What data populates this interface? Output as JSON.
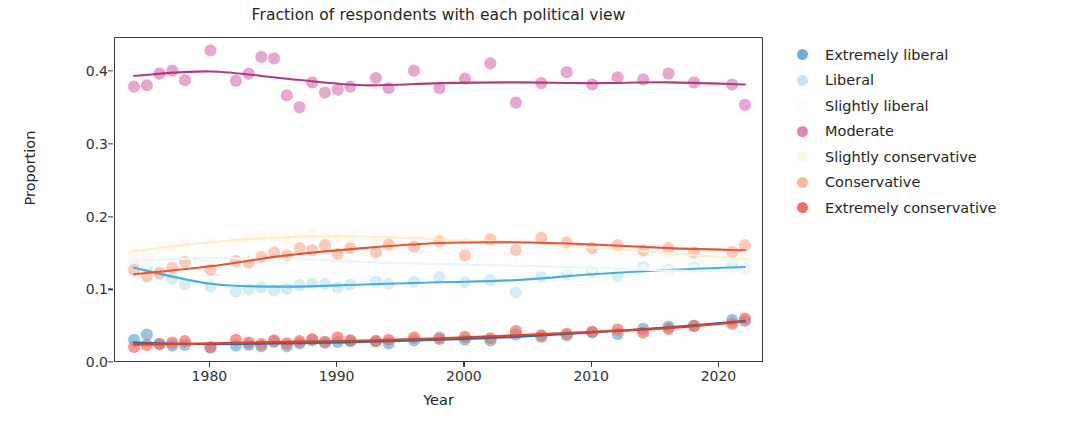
{
  "chart_data": {
    "type": "scatter",
    "title": "Fraction of respondents with each political view",
    "xlabel": "Year",
    "ylabel": "Proportion",
    "xlim": [
      1972.5,
      2023.5
    ],
    "ylim": [
      0.0,
      0.447
    ],
    "grid": false,
    "legend_position": "right",
    "xticks": [
      1980,
      1990,
      2000,
      2010,
      2020
    ],
    "xtick_labels": [
      "1980",
      "1990",
      "2000",
      "2010",
      "2020"
    ],
    "yticks": [
      0.0,
      0.1,
      0.2,
      0.3,
      0.4
    ],
    "ytick_labels": [
      "0.0",
      "0.1",
      "0.2",
      "0.3",
      "0.4"
    ],
    "marker_style": "filled-circle",
    "trendline_style": "lowess-smooth",
    "series": [
      {
        "name": "Extremely liberal",
        "color": "#6cb0da",
        "line_color": "#2a6f9e",
        "x": [
          1974,
          1975,
          1976,
          1977,
          1978,
          1980,
          1982,
          1983,
          1984,
          1985,
          1986,
          1987,
          1988,
          1989,
          1990,
          1991,
          1993,
          1994,
          1996,
          1998,
          2000,
          2002,
          2004,
          2006,
          2008,
          2010,
          2012,
          2014,
          2016,
          2018,
          2021,
          2022
        ],
        "y": [
          0.032,
          0.039,
          0.026,
          0.024,
          0.025,
          0.021,
          0.024,
          0.025,
          0.023,
          0.029,
          0.023,
          0.027,
          0.031,
          0.028,
          0.029,
          0.03,
          0.03,
          0.027,
          0.031,
          0.035,
          0.032,
          0.031,
          0.039,
          0.036,
          0.038,
          0.042,
          0.04,
          0.047,
          0.05,
          0.051,
          0.059,
          0.058
        ],
        "trend_x": [
          1974,
          1980,
          1986,
          1992,
          1998,
          2004,
          2010,
          2016,
          2022
        ],
        "trend_y": [
          0.028,
          0.026,
          0.027,
          0.029,
          0.032,
          0.036,
          0.042,
          0.049,
          0.058
        ]
      },
      {
        "name": "Liberal",
        "color": "#c3e6f2",
        "line_color": "#49aede",
        "x": [
          1974,
          1975,
          1976,
          1977,
          1978,
          1980,
          1982,
          1983,
          1984,
          1985,
          1986,
          1987,
          1988,
          1989,
          1990,
          1991,
          1993,
          1994,
          1996,
          1998,
          2000,
          2002,
          2004,
          2006,
          2008,
          2010,
          2012,
          2014,
          2016,
          2018,
          2021,
          2022
        ],
        "y": [
          0.139,
          0.13,
          0.122,
          0.116,
          0.108,
          0.105,
          0.098,
          0.101,
          0.104,
          0.1,
          0.102,
          0.107,
          0.11,
          0.109,
          0.104,
          0.108,
          0.112,
          0.109,
          0.112,
          0.118,
          0.111,
          0.114,
          0.097,
          0.119,
          0.122,
          0.126,
          0.12,
          0.132,
          0.128,
          0.131,
          0.136,
          0.129
        ],
        "trend_x": [
          1974,
          1980,
          1986,
          1992,
          1998,
          2004,
          2010,
          2016,
          2022
        ],
        "trend_y": [
          0.131,
          0.109,
          0.105,
          0.108,
          0.111,
          0.114,
          0.122,
          0.128,
          0.132
        ]
      },
      {
        "name": "Slightly liberal",
        "color": "#fbfdfa",
        "line_color": "#e9f5fb",
        "x": [
          1974,
          1975,
          1976,
          1977,
          1978,
          1980,
          1982,
          1983,
          1984,
          1985,
          1986,
          1987,
          1988,
          1989,
          1990,
          1991,
          1993,
          1994,
          1996,
          1998,
          2000,
          2002,
          2004,
          2006,
          2008,
          2010,
          2012,
          2014,
          2016,
          2018,
          2021,
          2022
        ],
        "y": [
          0.14,
          0.138,
          0.142,
          0.145,
          0.148,
          0.143,
          0.14,
          0.142,
          0.145,
          0.146,
          0.143,
          0.14,
          0.138,
          0.141,
          0.143,
          0.14,
          0.138,
          0.135,
          0.138,
          0.136,
          0.134,
          0.137,
          0.135,
          0.133,
          0.13,
          0.132,
          0.13,
          0.128,
          0.126,
          0.128,
          0.125,
          0.127
        ],
        "trend_x": [
          1974,
          1980,
          1986,
          1992,
          1998,
          2004,
          2010,
          2016,
          2022
        ],
        "trend_y": [
          0.141,
          0.144,
          0.143,
          0.139,
          0.136,
          0.134,
          0.131,
          0.127,
          0.126
        ]
      },
      {
        "name": "Moderate",
        "color": "#dd86bb",
        "line_color": "#b13a86",
        "x": [
          1974,
          1975,
          1976,
          1977,
          1978,
          1980,
          1982,
          1983,
          1984,
          1985,
          1986,
          1987,
          1988,
          1989,
          1990,
          1991,
          1993,
          1994,
          1996,
          1998,
          2000,
          2002,
          2004,
          2006,
          2008,
          2010,
          2012,
          2014,
          2016,
          2018,
          2021,
          2022
        ],
        "y": [
          0.38,
          0.382,
          0.398,
          0.402,
          0.389,
          0.43,
          0.388,
          0.398,
          0.421,
          0.419,
          0.368,
          0.352,
          0.386,
          0.372,
          0.376,
          0.38,
          0.392,
          0.378,
          0.402,
          0.378,
          0.391,
          0.412,
          0.358,
          0.385,
          0.4,
          0.383,
          0.393,
          0.39,
          0.398,
          0.386,
          0.383,
          0.355
        ],
        "trend_x": [
          1974,
          1980,
          1986,
          1992,
          1998,
          2004,
          2010,
          2016,
          2022
        ],
        "trend_y": [
          0.395,
          0.401,
          0.391,
          0.382,
          0.385,
          0.386,
          0.385,
          0.386,
          0.383
        ]
      },
      {
        "name": "Slightly conservative",
        "color": "#fdf8e6",
        "line_color": "#fdeccd",
        "x": [
          1974,
          1975,
          1976,
          1977,
          1978,
          1980,
          1982,
          1983,
          1984,
          1985,
          1986,
          1987,
          1988,
          1989,
          1990,
          1991,
          1993,
          1994,
          1996,
          1998,
          2000,
          2002,
          2004,
          2006,
          2008,
          2010,
          2012,
          2014,
          2016,
          2018,
          2021,
          2022
        ],
        "y": [
          0.152,
          0.148,
          0.158,
          0.16,
          0.163,
          0.166,
          0.168,
          0.17,
          0.172,
          0.175,
          0.17,
          0.176,
          0.178,
          0.174,
          0.172,
          0.175,
          0.17,
          0.172,
          0.168,
          0.17,
          0.166,
          0.165,
          0.168,
          0.163,
          0.16,
          0.158,
          0.155,
          0.152,
          0.15,
          0.148,
          0.142,
          0.145
        ],
        "trend_x": [
          1974,
          1980,
          1986,
          1992,
          1998,
          2004,
          2010,
          2016,
          2022
        ],
        "trend_y": [
          0.154,
          0.166,
          0.173,
          0.174,
          0.17,
          0.166,
          0.159,
          0.151,
          0.143
        ]
      },
      {
        "name": "Conservative",
        "color": "#fbb79c",
        "line_color": "#e2563a",
        "x": [
          1974,
          1975,
          1976,
          1977,
          1978,
          1980,
          1982,
          1983,
          1984,
          1985,
          1986,
          1987,
          1988,
          1989,
          1990,
          1991,
          1993,
          1994,
          1996,
          1998,
          2000,
          2002,
          2004,
          2006,
          2008,
          2010,
          2012,
          2014,
          2016,
          2018,
          2021,
          2022
        ],
        "y": [
          0.128,
          0.119,
          0.124,
          0.131,
          0.139,
          0.128,
          0.14,
          0.138,
          0.146,
          0.152,
          0.148,
          0.158,
          0.155,
          0.162,
          0.15,
          0.158,
          0.152,
          0.163,
          0.16,
          0.167,
          0.148,
          0.17,
          0.155,
          0.172,
          0.166,
          0.158,
          0.162,
          0.155,
          0.158,
          0.152,
          0.153,
          0.162
        ],
        "trend_x": [
          1974,
          1980,
          1986,
          1992,
          1998,
          2004,
          2010,
          2016,
          2022
        ],
        "trend_y": [
          0.122,
          0.133,
          0.148,
          0.158,
          0.165,
          0.166,
          0.163,
          0.158,
          0.155
        ]
      },
      {
        "name": "Extremely conservative",
        "color": "#f2705f",
        "line_color": "#e0402c",
        "x": [
          1974,
          1975,
          1976,
          1977,
          1978,
          1980,
          1982,
          1983,
          1984,
          1985,
          1986,
          1987,
          1988,
          1989,
          1990,
          1991,
          1993,
          1994,
          1996,
          1998,
          2000,
          2002,
          2004,
          2006,
          2008,
          2010,
          2012,
          2014,
          2016,
          2018,
          2021,
          2022
        ],
        "y": [
          0.022,
          0.025,
          0.026,
          0.028,
          0.03,
          0.022,
          0.032,
          0.028,
          0.026,
          0.031,
          0.027,
          0.03,
          0.033,
          0.029,
          0.035,
          0.031,
          0.03,
          0.032,
          0.035,
          0.033,
          0.036,
          0.034,
          0.044,
          0.038,
          0.04,
          0.043,
          0.046,
          0.042,
          0.047,
          0.051,
          0.054,
          0.061
        ],
        "trend_x": [
          1974,
          1980,
          1986,
          1992,
          1998,
          2004,
          2010,
          2016,
          2022
        ],
        "trend_y": [
          0.025,
          0.027,
          0.029,
          0.031,
          0.034,
          0.038,
          0.043,
          0.048,
          0.057
        ]
      }
    ]
  },
  "legend": {
    "items": [
      {
        "label": "Extremely liberal",
        "color": "#6cb0da"
      },
      {
        "label": "Liberal",
        "color": "#c3e6f2"
      },
      {
        "label": "Slightly liberal",
        "color": "#fbfdfa"
      },
      {
        "label": "Moderate",
        "color": "#dd86bb"
      },
      {
        "label": "Slightly conservative",
        "color": "#fdf8e6"
      },
      {
        "label": "Conservative",
        "color": "#fbb79c"
      },
      {
        "label": "Extremely conservative",
        "color": "#f2705f"
      }
    ]
  }
}
